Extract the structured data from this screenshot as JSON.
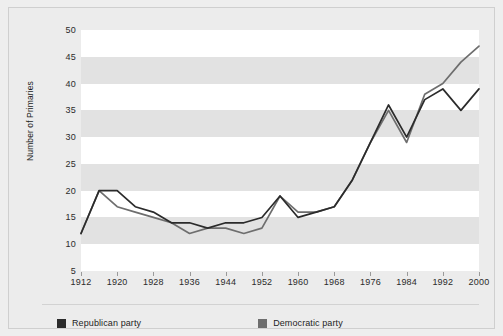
{
  "chart_data": {
    "type": "line",
    "title": "",
    "subtitle": "",
    "xlabel": "",
    "ylabel": "Number of Primaries",
    "xlim": [
      1912,
      2000
    ],
    "ylim": [
      5,
      50
    ],
    "grid": "horizontal alternating bands every 5 units",
    "legend_position": "bottom",
    "x": [
      1912,
      1916,
      1920,
      1924,
      1928,
      1932,
      1936,
      1940,
      1944,
      1948,
      1952,
      1956,
      1960,
      1964,
      1968,
      1972,
      1976,
      1980,
      1984,
      1988,
      1992,
      1996,
      2000
    ],
    "x_tick_labels": [
      "1912",
      "1920",
      "1928",
      "1936",
      "1944",
      "1952",
      "1960",
      "1968",
      "1976",
      "1984",
      "1992",
      "2000"
    ],
    "y_tick_labels": [
      "5",
      "10",
      "15",
      "20",
      "25",
      "30",
      "35",
      "40",
      "45",
      "50"
    ],
    "y_ticks": [
      5,
      10,
      15,
      20,
      25,
      30,
      35,
      40,
      45,
      50
    ],
    "series": [
      {
        "name": "Republican party",
        "color": "#2b2b2b",
        "values": [
          12,
          20,
          20,
          17,
          16,
          14,
          14,
          13,
          14,
          14,
          15,
          19,
          15,
          16,
          17,
          22,
          29,
          36,
          30,
          37,
          39,
          35,
          39
        ]
      },
      {
        "name": "Democratic party",
        "color": "#6e6e6e",
        "values": [
          12,
          20,
          17,
          16,
          15,
          14,
          12,
          13,
          13,
          12,
          13,
          19,
          16,
          16,
          17,
          22,
          29,
          35,
          29,
          38,
          40,
          44,
          47
        ]
      }
    ]
  },
  "axis": {
    "y_title": "Number of Primaries"
  },
  "legend": {
    "items": [
      {
        "label": "Republican party",
        "color": "#2b2b2b"
      },
      {
        "label": "Democratic party",
        "color": "#6e6e6e"
      }
    ]
  }
}
